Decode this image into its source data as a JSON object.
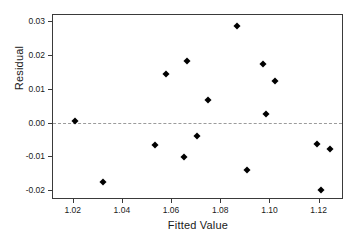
{
  "chart_data": {
    "type": "scatter",
    "title": "",
    "xlabel": "Fitted Value",
    "ylabel": "Residual",
    "xlim": [
      1.012,
      1.1295
    ],
    "ylim": [
      -0.0223,
      0.0318
    ],
    "grid": false,
    "legend": null,
    "xticks": [
      1.02,
      1.04,
      1.06,
      1.08,
      1.1,
      1.12
    ],
    "xtick_labels": [
      "1.02",
      "1.04",
      "1.06",
      "1.08",
      "1.10",
      "1.12"
    ],
    "yticks": [
      -0.02,
      -0.01,
      0.0,
      0.01,
      0.02,
      0.03
    ],
    "ytick_labels": [
      "-0.02",
      "-0.01",
      "0.00",
      "0.01",
      "0.02",
      "0.03"
    ],
    "reference_line": {
      "orientation": "horizontal",
      "y": 0.0,
      "style": "dashed",
      "color": "#9b9b9b"
    },
    "marker": {
      "shape": "diamond",
      "color": "#000000",
      "size": 5
    },
    "points": [
      {
        "x": 1.021,
        "y": 0.0004
      },
      {
        "x": 1.0325,
        "y": -0.0177
      },
      {
        "x": 1.0533,
        "y": -0.0065
      },
      {
        "x": 1.058,
        "y": 0.0144
      },
      {
        "x": 1.0653,
        "y": -0.0103
      },
      {
        "x": 1.0663,
        "y": 0.0183
      },
      {
        "x": 1.0707,
        "y": -0.004
      },
      {
        "x": 1.075,
        "y": 0.0067
      },
      {
        "x": 1.0868,
        "y": 0.0286
      },
      {
        "x": 1.091,
        "y": -0.0139
      },
      {
        "x": 1.0975,
        "y": 0.0173
      },
      {
        "x": 1.0987,
        "y": 0.0025
      },
      {
        "x": 1.1022,
        "y": 0.0122
      },
      {
        "x": 1.1193,
        "y": -0.0063
      },
      {
        "x": 1.1208,
        "y": -0.0199
      },
      {
        "x": 1.1245,
        "y": -0.0077
      }
    ]
  }
}
